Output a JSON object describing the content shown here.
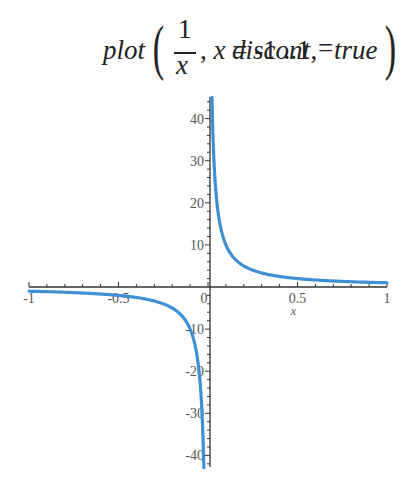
{
  "command": {
    "func": "plot",
    "numerator": "1",
    "denominator": "x",
    "range": ", x = -1 ..1,",
    "option_name": "discont",
    "option_eq": "=",
    "option_value": "true"
  },
  "chart_data": {
    "type": "line",
    "function": "1/x",
    "xlabel": "x",
    "ylabel": "",
    "xlim": [
      -1,
      1
    ],
    "ylim": [
      -44,
      45
    ],
    "grid": false,
    "legend": null,
    "x_ticks": [
      "-1",
      "-0.5",
      "0",
      "0.5",
      "1"
    ],
    "y_ticks": [
      "40",
      "30",
      "20",
      "10",
      "-10",
      "-20",
      "-30",
      "-40"
    ],
    "series": [
      {
        "name": "1/x (x<0)",
        "color": "#3f8fd4",
        "x": [
          -1,
          -0.8,
          -0.6,
          -0.5,
          -0.4,
          -0.3,
          -0.2,
          -0.15,
          -0.1,
          -0.08,
          -0.06,
          -0.05,
          -0.04,
          -0.03,
          -0.0233
        ],
        "y": [
          -1,
          -1.25,
          -1.67,
          -2,
          -2.5,
          -3.33,
          -5,
          -6.67,
          -10,
          -12.5,
          -16.67,
          -20,
          -25,
          -33.3,
          -43
        ]
      },
      {
        "name": "1/x (x>0)",
        "color": "#3f8fd4",
        "x": [
          0.0222,
          0.03,
          0.04,
          0.05,
          0.06,
          0.08,
          0.1,
          0.15,
          0.2,
          0.3,
          0.4,
          0.5,
          0.6,
          0.8,
          1
        ],
        "y": [
          45,
          33.3,
          25,
          20,
          16.67,
          12.5,
          10,
          6.67,
          5,
          3.33,
          2.5,
          2,
          1.67,
          1.25,
          1
        ]
      }
    ],
    "axis_color": "#333333",
    "curve_color": "#3f8fd4"
  }
}
